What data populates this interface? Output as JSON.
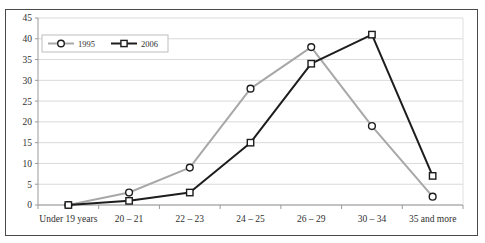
{
  "figure": {
    "background_color": "#ffffff",
    "frame_color": "#4a4a4a",
    "plot_background_color": "#ffffff",
    "gridline_color": "#d9d9d9",
    "axis_color": "#9a9a9a"
  },
  "chart_data": {
    "type": "line",
    "title": "",
    "subtitle": "",
    "xlabel": "",
    "ylabel": "",
    "categories": [
      "Under 19 years",
      "20 – 21",
      "22 – 23",
      "24 – 25",
      "26 – 29",
      "30 – 34",
      "35 and more"
    ],
    "series": [
      {
        "name": "1995",
        "values": [
          0,
          3,
          9,
          28,
          38,
          19,
          2
        ],
        "color": "#a8a8a8",
        "marker": "circle",
        "marker_fill": "#ffffff",
        "marker_edge": "#1d1d1d",
        "line_width": 2.0
      },
      {
        "name": "2006",
        "values": [
          0,
          1,
          3,
          15,
          34,
          41,
          7
        ],
        "color": "#1d1d1d",
        "marker": "square",
        "marker_fill": "#ffffff",
        "marker_edge": "#1d1d1d",
        "line_width": 2.0
      }
    ],
    "ylim": [
      0,
      45
    ],
    "yticks": [
      0,
      5,
      10,
      15,
      20,
      25,
      30,
      35,
      40,
      45
    ],
    "ytick_labels": [
      "0",
      "5",
      "10",
      "15",
      "20",
      "25",
      "30",
      "35",
      "40",
      "45"
    ],
    "grid": true,
    "grid_axis": "y",
    "legend": {
      "position": "upper-left-inside",
      "entries": [
        "1995",
        "2006"
      ],
      "border_color": "#bdbdbd",
      "background_color": "#ffffff"
    }
  }
}
